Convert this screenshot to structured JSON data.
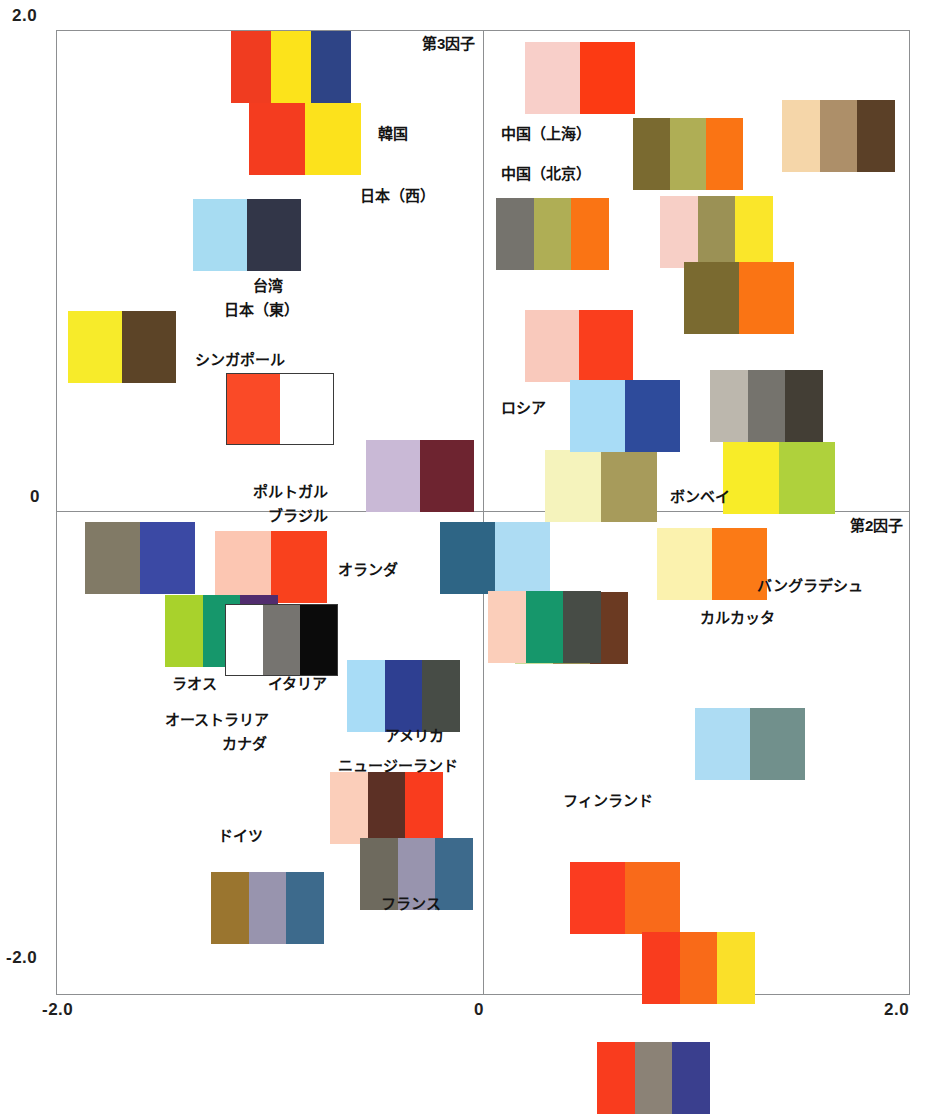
{
  "chart_data": {
    "type": "scatter",
    "title": "",
    "xlabel": "第2因子",
    "ylabel": "第3因子",
    "xlim": [
      -2.0,
      2.0
    ],
    "ylim": [
      -2.0,
      2.0
    ],
    "grid": false,
    "legend": "none",
    "axis": {
      "y_name": "第3因子",
      "x_name": "第2因子",
      "y_ticks": [
        "2.0",
        "0",
        "-2.0"
      ],
      "x_ticks": [
        "-2.0",
        "0",
        "2.0"
      ]
    },
    "note": "Each data point is rendered as a multi-band colour swatch (colour-scheme image) positioned at its factor-score coordinates; text labels name the country/city.",
    "points": [
      {
        "label": "韓国",
        "x": -0.42,
        "y": 1.62,
        "swatch_index": 1
      },
      {
        "label": "日本（西）",
        "x": -0.33,
        "y": 1.3,
        "swatch_index": 2
      },
      {
        "label": "台湾",
        "x": -0.53,
        "y": 0.82,
        "swatch_index": 3
      },
      {
        "label": "日本（東）",
        "x": -0.55,
        "y": 0.7,
        "swatch_index": 3
      },
      {
        "label": "シンガポール",
        "x": -1.3,
        "y": 0.58,
        "swatch_index": 4
      },
      {
        "label": "ポルトガル",
        "x": -0.6,
        "y": 0.12,
        "swatch_index": 5
      },
      {
        "label": "ブラジル",
        "x": -0.3,
        "y": 0.18,
        "swatch_index": 6
      },
      {
        "label": "中国（上海）",
        "x": 0.75,
        "y": 1.8,
        "swatch_index": 7
      },
      {
        "label": "中国（北京）",
        "x": 0.98,
        "y": 1.38,
        "swatch_index": 8
      },
      {
        "label": "ロシア",
        "x": 0.85,
        "y": 0.42,
        "swatch_index": 9
      },
      {
        "label": "ボンベイ",
        "x": 1.05,
        "y": 0.1,
        "swatch_index": 10
      },
      {
        "label": "オランダ",
        "x": -0.05,
        "y": -0.12,
        "swatch_index": 11
      },
      {
        "label": "ラオス",
        "x": -1.22,
        "y": -0.52,
        "swatch_index": 12
      },
      {
        "label": "イタリア",
        "x": -0.72,
        "y": -0.55,
        "swatch_index": 13
      },
      {
        "label": "オーストラリア",
        "x": -0.92,
        "y": -0.78,
        "swatch_index": 14
      },
      {
        "label": "カナダ",
        "x": -0.8,
        "y": -0.88,
        "swatch_index": 14
      },
      {
        "label": "アメリカ",
        "x": -0.3,
        "y": -0.7,
        "swatch_index": 15
      },
      {
        "label": "ニュージーランド",
        "x": -0.25,
        "y": -1.05,
        "swatch_index": 16
      },
      {
        "label": "ドイツ",
        "x": -0.95,
        "y": -1.22,
        "swatch_index": 17
      },
      {
        "label": "フランス",
        "x": -0.55,
        "y": -1.35,
        "swatch_index": 18
      },
      {
        "label": "バングラデシュ",
        "x": 0.95,
        "y": -0.18,
        "swatch_index": 19
      },
      {
        "label": "カルカッタ",
        "x": 0.7,
        "y": -0.4,
        "swatch_index": 20
      },
      {
        "label": "フィンランド",
        "x": 1.18,
        "y": -0.95,
        "swatch_index": 21
      }
    ]
  },
  "ticks": {
    "y_top": "2.0",
    "y_zero": "0",
    "y_bottom": "-2.0",
    "x_left": "-2.0",
    "x_zero": "0",
    "x_right": "2.0"
  },
  "axes": {
    "y_label": "第3因子",
    "x_label": "第2因子"
  },
  "labels": [
    {
      "text": "韓国",
      "left": 378,
      "top": 126
    },
    {
      "text": "日本（西）",
      "left": 360,
      "top": 188
    },
    {
      "text": "台湾",
      "left": 253,
      "top": 278
    },
    {
      "text": "日本（東）",
      "left": 224,
      "top": 302
    },
    {
      "text": "シンガポール",
      "left": 195,
      "top": 352
    },
    {
      "text": "ポルトガル",
      "left": 253,
      "top": 484
    },
    {
      "text": "ブラジル",
      "left": 268,
      "top": 508
    },
    {
      "text": "中国（上海）",
      "left": 501,
      "top": 126
    },
    {
      "text": "中国（北京）",
      "left": 501,
      "top": 166
    },
    {
      "text": "ロシア",
      "left": 501,
      "top": 400
    },
    {
      "text": "ボンベイ",
      "left": 670,
      "top": 489
    },
    {
      "text": "オランダ",
      "left": 338,
      "top": 562
    },
    {
      "text": "ラオス",
      "left": 172,
      "top": 676
    },
    {
      "text": "イタリア",
      "left": 268,
      "top": 676
    },
    {
      "text": "オーストラリア",
      "left": 165,
      "top": 712
    },
    {
      "text": "カナダ",
      "left": 222,
      "top": 736
    },
    {
      "text": "アメリカ",
      "left": 385,
      "top": 728
    },
    {
      "text": "ニュージーランド",
      "left": 338,
      "top": 758
    },
    {
      "text": "ドイツ",
      "left": 218,
      "top": 828
    },
    {
      "text": "フランス",
      "left": 381,
      "top": 896
    },
    {
      "text": "バングラデシュ",
      "left": 757,
      "top": 578
    },
    {
      "text": "カルカッタ",
      "left": 700,
      "top": 610
    },
    {
      "text": "フィンランド",
      "left": 563,
      "top": 793
    }
  ],
  "swatches": [
    {
      "name": "swatch-korea-upper",
      "left": 231,
      "top": 31,
      "w": 120,
      "bands": [
        "#F03C20",
        "#FCE31B",
        "#2E4486"
      ],
      "border": false
    },
    {
      "name": "swatch-korea",
      "left": 249,
      "top": 103,
      "w": 112,
      "bands": [
        "#F43C1F",
        "#FCE21C"
      ],
      "border": false
    },
    {
      "name": "swatch-japan-west",
      "left": 193,
      "top": 199,
      "w": 108,
      "bands": [
        "#A7DCF2",
        "#323648"
      ],
      "border": false
    },
    {
      "name": "swatch-taiwan-japan-east",
      "left": 68,
      "top": 311,
      "w": 108,
      "bands": [
        "#F7EB2A",
        "#5C4427"
      ],
      "border": false
    },
    {
      "name": "swatch-singapore",
      "left": 226,
      "top": 373,
      "w": 108,
      "bands": [
        "#FA4A27",
        "#FFFFFF"
      ],
      "border": true
    },
    {
      "name": "swatch-portugal",
      "left": 366,
      "top": 440,
      "w": 108,
      "bands": [
        "#C9B9D6",
        "#6E2430"
      ],
      "border": false
    },
    {
      "name": "swatch-brazil",
      "left": 215,
      "top": 531,
      "w": 112,
      "bands": [
        "#FCC6B2",
        "#F9411D"
      ],
      "border": false
    },
    {
      "name": "swatch-china-shanghai",
      "left": 525,
      "top": 42,
      "w": 110,
      "bands": [
        "#F8CFC9",
        "#FC3A13"
      ],
      "border": false
    },
    {
      "name": "swatch-china-beijing",
      "left": 633,
      "top": 118,
      "w": 110,
      "bands": [
        "#7A6A30",
        "#AFAE55",
        "#FA7414"
      ],
      "border": false
    },
    {
      "name": "swatch-russia-band",
      "left": 525,
      "top": 310,
      "w": 108,
      "bands": [
        "#F9C9BC",
        "#FA3E1D"
      ],
      "border": false
    },
    {
      "name": "swatch-bombay",
      "left": 545,
      "top": 450,
      "w": 112,
      "bands": [
        "#F5F3BC",
        "#A79B5B"
      ],
      "border": false
    },
    {
      "name": "swatch-netherlands",
      "left": 440,
      "top": 522,
      "w": 110,
      "bands": [
        "#2E6585",
        "#ADDCF3"
      ],
      "border": false
    },
    {
      "name": "swatch-laos",
      "left": 165,
      "top": 595,
      "w": 113,
      "bands": [
        "#A8D22C",
        "#16976B",
        "#512C6E"
      ],
      "border": false
    },
    {
      "name": "swatch-italy",
      "left": 225,
      "top": 604,
      "w": 113,
      "bands": [
        "#FFFFFF",
        "#767470",
        "#0B0B0B"
      ],
      "border": true
    },
    {
      "name": "swatch-australia-canada",
      "left": 85,
      "top": 522,
      "w": 110,
      "bands": [
        "#817A66",
        "#3B49A4"
      ],
      "border": false
    },
    {
      "name": "swatch-america",
      "left": 347,
      "top": 660,
      "w": 113,
      "bands": [
        "#A8DCF6",
        "#2E3F91",
        "#474C46"
      ],
      "border": false
    },
    {
      "name": "swatch-newzealand",
      "left": 330,
      "top": 772,
      "w": 113,
      "bands": [
        "#FBCEBA",
        "#5C3025",
        "#F93C1E"
      ],
      "border": false
    },
    {
      "name": "swatch-germany",
      "left": 211,
      "top": 872,
      "w": 113,
      "bands": [
        "#9A752F",
        "#9894AE",
        "#3D6A8C"
      ],
      "border": false
    },
    {
      "name": "swatch-france",
      "left": 360,
      "top": 838,
      "w": 113,
      "bands": [
        "#6E6A5E",
        "#9894AE",
        "#3D6A8C"
      ],
      "border": false
    },
    {
      "name": "swatch-bangladesh",
      "left": 657,
      "top": 528,
      "w": 110,
      "bands": [
        "#FBF2AE",
        "#FB7A16"
      ],
      "border": false
    },
    {
      "name": "swatch-calcutta",
      "left": 515,
      "top": 592,
      "w": 113,
      "bands": [
        "#CBDD9A",
        "#9B9155",
        "#6B3A22"
      ],
      "border": false
    },
    {
      "name": "swatch-finland",
      "left": 695,
      "top": 708,
      "w": 110,
      "bands": [
        "#ADDCF3",
        "#71908C"
      ],
      "border": false
    },
    {
      "name": "swatch-green-flag",
      "left": 488,
      "top": 591,
      "w": 113,
      "bands": [
        "#FBCEBA",
        "#16976B",
        "#474C46"
      ],
      "border": false
    },
    {
      "name": "swatch-grey-triple",
      "left": 710,
      "top": 370,
      "w": 113,
      "bands": [
        "#BCB7AD",
        "#75736D",
        "#433E35"
      ],
      "border": false
    },
    {
      "name": "swatch-russia-flag",
      "left": 570,
      "top": 380,
      "w": 110,
      "bands": [
        "#A8DCF6",
        "#2E4B9B"
      ],
      "border": false
    },
    {
      "name": "swatch-yellow-green",
      "left": 723,
      "top": 442,
      "w": 112,
      "bands": [
        "#F8EC28",
        "#AFD13C"
      ],
      "border": false
    },
    {
      "name": "swatch-beige-triple",
      "left": 782,
      "top": 100,
      "w": 113,
      "bands": [
        "#F5D6A9",
        "#AD8F69",
        "#5B4027"
      ],
      "border": false
    },
    {
      "name": "swatch-pink-olive-yellow",
      "left": 660,
      "top": 196,
      "w": 113,
      "bands": [
        "#F7CFC6",
        "#9B9155",
        "#FAE62A"
      ],
      "border": false
    },
    {
      "name": "swatch-grey-olive-orange",
      "left": 496,
      "top": 198,
      "w": 113,
      "bands": [
        "#75736D",
        "#AFAE55",
        "#FA7414"
      ],
      "border": false
    },
    {
      "name": "swatch-olive-orange",
      "left": 684,
      "top": 262,
      "w": 110,
      "bands": [
        "#7A6A30",
        "#FA7414"
      ],
      "border": false
    },
    {
      "name": "swatch-red-orange-lower",
      "left": 570,
      "top": 862,
      "w": 110,
      "bands": [
        "#FB3C20",
        "#F96A1A"
      ],
      "border": false
    },
    {
      "name": "swatch-red-orange-yellow",
      "left": 642,
      "top": 932,
      "w": 113,
      "bands": [
        "#F93C1E",
        "#F96A18",
        "#FAE029"
      ],
      "border": false
    },
    {
      "name": "swatch-bottom-outside",
      "left": 597,
      "top": 1042,
      "w": 113,
      "bands": [
        "#F93C1E",
        "#8B8276",
        "#3A3F8E"
      ],
      "border": false
    }
  ]
}
